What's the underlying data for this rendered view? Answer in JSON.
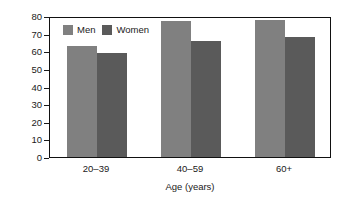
{
  "chart_data": {
    "type": "bar",
    "title": "",
    "subtitle": "",
    "xlabel": "Age (years)",
    "ylabel": "Percentage of U.S. Adults",
    "categories": [
      "20–39",
      "40–59",
      "60+"
    ],
    "series": [
      {
        "name": "Men",
        "color": "#808080",
        "values": [
          63,
          77,
          78
        ]
      },
      {
        "name": "Women",
        "color": "#5a5a5a",
        "values": [
          59,
          66,
          68
        ]
      }
    ],
    "ylim": [
      0,
      80
    ],
    "ytick_step": 10,
    "yticks": [
      0,
      10,
      20,
      30,
      40,
      50,
      60,
      70,
      80
    ],
    "ytick_labels": [
      "0",
      "10",
      "20",
      "30",
      "40",
      "50",
      "60",
      "70",
      "80"
    ],
    "grid": false,
    "legend_position": "top-left-inside",
    "legend_entries": [
      "Men",
      "Women"
    ],
    "frame": true,
    "frame_color": "#111111",
    "background": "#ffffff"
  }
}
